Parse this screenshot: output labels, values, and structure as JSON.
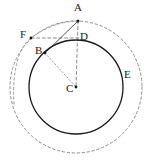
{
  "figure": {
    "width": 153,
    "height": 168,
    "background": "#ffffff",
    "colors": {
      "solid_stroke": "#1a1a1a",
      "dashed_stroke": "#8c8c8c",
      "dotted_stroke": "#8c8c8c",
      "label_text": "#1a1a1a"
    },
    "center": {
      "x": 76,
      "y": 87
    },
    "circles": [
      {
        "name": "inner-solid-circle",
        "cx": 76,
        "cy": 87,
        "r": 47,
        "style": "solid",
        "stroke": "#1a1a1a",
        "stroke_width": 1.3
      },
      {
        "name": "outer-dashed-circle",
        "cx": 76,
        "cy": 87,
        "r": 66,
        "style": "dashed",
        "stroke": "#8c8c8c",
        "stroke_width": 1
      }
    ],
    "points": [
      {
        "id": "A",
        "label": "A",
        "x": 78,
        "y": 21,
        "label_x": 74,
        "label_y": 2,
        "marker": true
      },
      {
        "id": "F",
        "label": "F",
        "x": 31,
        "y": 38,
        "label_x": 20,
        "label_y": 29,
        "marker": true
      },
      {
        "id": "D",
        "label": "D",
        "x": 78,
        "y": 40,
        "label_x": 80,
        "label_y": 31,
        "marker": false
      },
      {
        "id": "B",
        "label": "B",
        "x": 45,
        "y": 53,
        "label_x": 35,
        "label_y": 45,
        "marker": true
      },
      {
        "id": "E",
        "label": "E",
        "x": 122,
        "y": 76,
        "label_x": 124,
        "label_y": 69,
        "marker": false
      },
      {
        "id": "C",
        "label": "C",
        "x": 76,
        "y": 87,
        "label_x": 66,
        "label_y": 83,
        "marker": true
      }
    ],
    "segments": [
      {
        "name": "segment-A-B",
        "from": "A",
        "to": "B",
        "style": "solid",
        "stroke": "#555555",
        "stroke_width": 1
      },
      {
        "name": "segment-A-C",
        "from": "A",
        "to": "C",
        "style": "dashed",
        "stroke": "#8c8c8c",
        "stroke_width": 1
      },
      {
        "name": "segment-F-D",
        "from": "F",
        "to": "D",
        "style": "dashed",
        "stroke": "#8c8c8c",
        "stroke_width": 1
      },
      {
        "name": "segment-B-C",
        "from": "B",
        "to": "C",
        "style": "dotted",
        "stroke": "#9a9a9a",
        "stroke_width": 1
      },
      {
        "name": "segment-F-A",
        "from": "F",
        "to": "A",
        "style": "dotted",
        "stroke": "#9a9a9a",
        "stroke_width": 1
      }
    ],
    "arcs": [
      {
        "name": "arc-through-F",
        "description": "dashed arc from lower left passing through F up toward A",
        "path": "M 14 104 C 12 72 18 48 31 38 C 47 26 64 21 78 21",
        "style": "dashed",
        "stroke": "#9a9a9a",
        "stroke_width": 1
      }
    ]
  }
}
